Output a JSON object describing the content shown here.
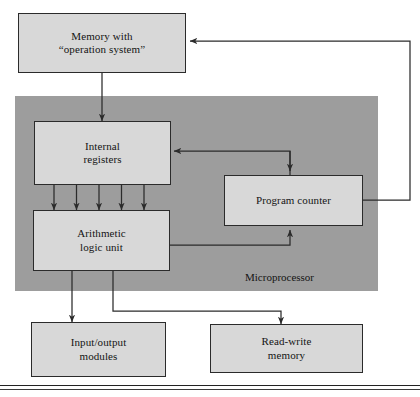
{
  "figure": {
    "width": 420,
    "height": 397,
    "colors": {
      "chip_fill": "#9d9d9d",
      "box_fill": "#d8d8d8",
      "stroke": "#2b2b2b",
      "text": "#141414",
      "page": "#ffffff"
    }
  },
  "regions": {
    "microprocessor": {
      "caption": "Microprocessor"
    }
  },
  "nodes": {
    "memory_os": {
      "label": "Memory with\n“operation system”"
    },
    "internal_registers": {
      "label": "Internal\nregisters"
    },
    "program_counter": {
      "label": "Program counter"
    },
    "arithmetic_logic_unit": {
      "label": "Arithmetic\nlogic unit"
    },
    "io_modules": {
      "label": "Input/output\nmodules"
    },
    "read_write_memory": {
      "label": "Read-write\nmemory"
    }
  },
  "connections": [
    {
      "name": "memory-to-internal-registers",
      "from": "memory_os",
      "to": "internal_registers",
      "arrow": "single"
    },
    {
      "name": "program-counter-to-memory",
      "from": "program_counter",
      "to": "memory_os",
      "arrow": "single"
    },
    {
      "name": "program-counter-to-internal-registers",
      "from": "program_counter",
      "to": "internal_registers",
      "arrow": "single"
    },
    {
      "name": "internal-registers-to-alu-bus",
      "from": "internal_registers",
      "to": "arithmetic_logic_unit",
      "arrow": "single",
      "lines": 5
    },
    {
      "name": "alu-to-program-counter",
      "from": "arithmetic_logic_unit",
      "to": "program_counter",
      "arrow": "single"
    },
    {
      "name": "alu-to-io-modules",
      "from": "arithmetic_logic_unit",
      "to": "io_modules",
      "arrow": "double"
    },
    {
      "name": "alu-to-read-write-memory",
      "from": "arithmetic_logic_unit",
      "to": "read_write_memory",
      "arrow": "double"
    }
  ]
}
